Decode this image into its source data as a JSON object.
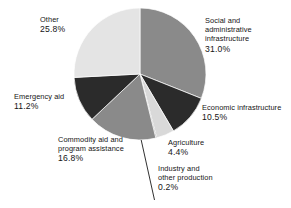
{
  "chart_data": {
    "type": "pie",
    "title": "",
    "subtitle": "",
    "xlabel": "",
    "ylabel": "",
    "legend_position": "none",
    "grid": false,
    "value_unit": "%",
    "start_angle_deg": 0,
    "direction": "clockwise",
    "categories": [
      "Social and administrative infrastructure",
      "Economic infrastructure",
      "Agriculture",
      "Industry and other production",
      "Commodity aid and program assistance",
      "Emergency aid",
      "Other"
    ],
    "values": [
      31.0,
      10.5,
      4.4,
      0.2,
      16.8,
      11.2,
      25.8
    ],
    "colors": [
      "#8a8a8a",
      "#2b2b2b",
      "#d9d9d9",
      "#2b2b2b",
      "#8a8a8a",
      "#2b2b2b",
      "#e4e4e4"
    ],
    "slices": [
      {
        "name": "social-and-administrative-infrastructure",
        "label_lines": [
          "Social and",
          "administrative",
          "infrastructure"
        ],
        "value": 31.0,
        "value_text": "31.0%",
        "color": "#8a8a8a"
      },
      {
        "name": "economic-infrastructure",
        "label_lines": [
          "Economic infrastructure"
        ],
        "value": 10.5,
        "value_text": "10.5%",
        "color": "#2b2b2b"
      },
      {
        "name": "agriculture",
        "label_lines": [
          "Agriculture"
        ],
        "value": 4.4,
        "value_text": "4.4%",
        "color": "#d9d9d9"
      },
      {
        "name": "industry-and-other-production",
        "label_lines": [
          "Industry and",
          "other production"
        ],
        "value": 0.2,
        "value_text": "0.2%",
        "color": "#2b2b2b"
      },
      {
        "name": "commodity-aid-and-program-assistance",
        "label_lines": [
          "Commodity aid and",
          "program assistance"
        ],
        "value": 16.8,
        "value_text": "16.8%",
        "color": "#8a8a8a"
      },
      {
        "name": "emergency-aid",
        "label_lines": [
          "Emergency aid"
        ],
        "value": 11.2,
        "value_text": "11.2%",
        "color": "#2b2b2b"
      },
      {
        "name": "other",
        "label_lines": [
          "Other"
        ],
        "value": 25.8,
        "value_text": "25.8%",
        "color": "#e4e4e4"
      }
    ]
  },
  "labels": {
    "social": {
      "l1": "Social and",
      "l2": "administrative",
      "l3": "infrastructure",
      "pct": "31.0%"
    },
    "economic": {
      "l1": "Economic infrastructure",
      "pct": "10.5%"
    },
    "agriculture": {
      "l1": "Agriculture",
      "pct": "4.4%"
    },
    "industry": {
      "l1": "Industry and",
      "l2": "other production",
      "pct": "0.2%"
    },
    "commodity": {
      "l1": "Commodity aid and",
      "l2": "program assistance",
      "pct": "16.8%"
    },
    "emergency": {
      "l1": "Emergency aid",
      "pct": "11.2%"
    },
    "other": {
      "l1": "Other",
      "pct": "25.8%"
    }
  }
}
